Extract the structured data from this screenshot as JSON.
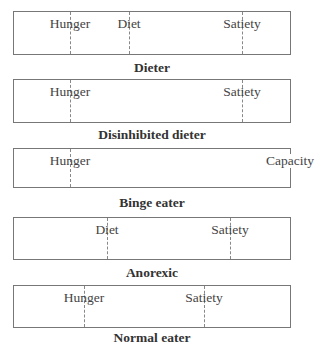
{
  "panels": [
    {
      "caption": "Dieter",
      "markers": [
        {
          "label": "Hunger",
          "x": 56
        },
        {
          "label": "Diet",
          "x": 115
        },
        {
          "label": "Satiety",
          "x": 228
        }
      ]
    },
    {
      "caption": "Disinhibited dieter",
      "markers": [
        {
          "label": "Hunger",
          "x": 56
        },
        {
          "label": "Satiety",
          "x": 228
        }
      ]
    },
    {
      "caption": "Binge eater",
      "markers": [
        {
          "label": "Hunger",
          "x": 56
        },
        {
          "label": "Capacity",
          "x": 278
        }
      ]
    },
    {
      "caption": "Anorexic",
      "markers": [
        {
          "label": "Diet",
          "x": 93
        },
        {
          "label": "Satiety",
          "x": 216
        }
      ]
    },
    {
      "caption": "Normal eater",
      "markers": [
        {
          "label": "Hunger",
          "x": 70
        },
        {
          "label": "Satiety",
          "x": 190
        }
      ]
    }
  ]
}
